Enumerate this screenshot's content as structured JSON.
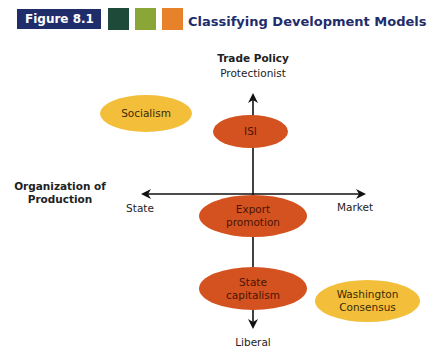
{
  "header": {
    "figure_label": "Figure 8.1",
    "title": "Classifying Development Models",
    "swatches": [
      "#1e4a3a",
      "#8aa637",
      "#e8822a"
    ],
    "badge_color": "#1f2d6b"
  },
  "axes": {
    "vertical": {
      "title": "Trade Policy",
      "top_label": "Protectionist",
      "bottom_label": "Liberal"
    },
    "horizontal": {
      "title": "Organization of Production",
      "title_line1": "Organization of",
      "title_line2": "Production",
      "left_label": "State",
      "right_label": "Market"
    }
  },
  "nodes": [
    {
      "id": "socialism",
      "label": "Socialism",
      "color": "#f3bf3b"
    },
    {
      "id": "isi",
      "label": "ISI",
      "color": "#d4521f"
    },
    {
      "id": "export",
      "label_line1": "Export",
      "label_line2": "promotion",
      "color": "#d4521f"
    },
    {
      "id": "state-cap",
      "label_line1": "State",
      "label_line2": "capitalism",
      "color": "#d4521f"
    },
    {
      "id": "washington",
      "label_line1": "Washington",
      "label_line2": "Consensus",
      "color": "#f3bf3b"
    }
  ]
}
